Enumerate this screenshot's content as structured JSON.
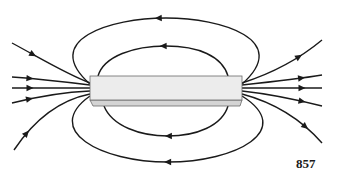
{
  "figure": {
    "figure_number": "857",
    "colors": {
      "line": "#1a1a1a",
      "magnet_face": "#ececec",
      "magnet_bevel": "#d4d4d4",
      "magnet_edge": "#6a6a6a",
      "background": "#ffffff"
    },
    "magnet": {
      "x": 90,
      "y": 76,
      "width": 152,
      "face_height": 24,
      "bevel_height": 6
    },
    "field_lines": [
      {
        "id": "top-outer-loop",
        "d": "M 90 84 C 40 40, 110 18, 166 18 C 222 18, 292 40, 242 84",
        "arrow": {
          "x": 158,
          "y": 18,
          "dir": "left"
        }
      },
      {
        "id": "top-inner-loop",
        "d": "M 98 76 C 104 56, 134 46, 166 46 C 198 46, 222 56, 228 76",
        "arrow": {
          "x": 163,
          "y": 46,
          "dir": "left"
        }
      },
      {
        "id": "bottom-inner-loop",
        "d": "M 104 106 C 112 126, 140 136, 168 136 C 196 136, 222 126, 228 106",
        "arrow": {
          "x": 168,
          "y": 136,
          "dir": "left"
        }
      },
      {
        "id": "bottom-outer-loop",
        "d": "M 90 96 C 42 130, 100 162, 168 162 C 236 162, 296 130, 242 96",
        "arrow": {
          "x": 168,
          "y": 162,
          "dir": "left"
        }
      },
      {
        "id": "left-fan-1",
        "d": "M 12 43 C 40 58, 66 74, 90 83",
        "arrow": {
          "x": 32,
          "y": 56,
          "dir": "in"
        }
      },
      {
        "id": "left-fan-2",
        "d": "M 12 77 C 40 79, 66 82, 90 85",
        "arrow": {
          "x": 30,
          "y": 79,
          "dir": "in"
        }
      },
      {
        "id": "left-fan-3",
        "d": "M 12 88 L 90 88",
        "arrow": {
          "x": 30,
          "y": 88,
          "dir": "in"
        }
      },
      {
        "id": "left-fan-4",
        "d": "M 12 103 C 40 96, 66 92, 90 91",
        "arrow": {
          "x": 30,
          "y": 99,
          "dir": "in"
        }
      },
      {
        "id": "left-fan-5",
        "d": "M 14 150 C 34 120, 60 100, 90 94",
        "arrow": {
          "x": 27,
          "y": 134,
          "dir": "in"
        }
      },
      {
        "id": "right-fan-1",
        "d": "M 242 83 C 270 74, 298 60, 322 40",
        "arrow": {
          "x": 300,
          "y": 58,
          "dir": "out"
        }
      },
      {
        "id": "right-fan-2",
        "d": "M 242 85 C 270 82, 298 79, 322 75",
        "arrow": {
          "x": 302,
          "y": 79,
          "dir": "out"
        }
      },
      {
        "id": "right-fan-3",
        "d": "M 242 88 L 322 88",
        "arrow": {
          "x": 302,
          "y": 88,
          "dir": "out"
        }
      },
      {
        "id": "right-fan-4",
        "d": "M 242 91 C 270 94, 298 100, 322 106",
        "arrow": {
          "x": 302,
          "y": 101,
          "dir": "out"
        }
      },
      {
        "id": "right-fan-5",
        "d": "M 242 94 C 272 102, 300 118, 322 143",
        "arrow": {
          "x": 305,
          "y": 128,
          "dir": "out"
        }
      }
    ]
  }
}
